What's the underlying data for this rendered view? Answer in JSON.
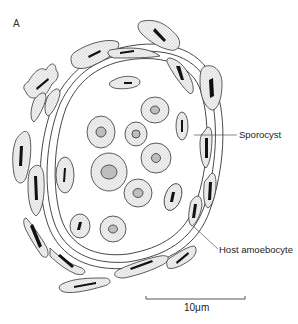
{
  "figure": {
    "panel_letter": "A",
    "labels": {
      "sporocyst": "Sporocyst",
      "host_amoebocyte": "Host amoebocyte"
    },
    "scale_bar": {
      "label": "10μm",
      "length_um": 10
    }
  },
  "colors": {
    "line": "#333333",
    "stipple": "#e6e6e6",
    "nucleus_dark": "#111111",
    "nucleus_grey": "#b5b5b5"
  }
}
